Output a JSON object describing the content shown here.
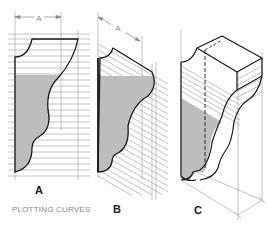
{
  "figure": {
    "caption": "PLOTTING CURVES",
    "panels": [
      {
        "id": "A",
        "label": "A",
        "view": "front elevation with horizontal plotting lines"
      },
      {
        "id": "B",
        "label": "B",
        "view": "oblique profile with slanted plotting lines"
      },
      {
        "id": "C",
        "label": "C",
        "view": "isometric block with plotted curved face"
      }
    ],
    "dimension_labels": {
      "panel_a": "A",
      "panel_b": "A"
    },
    "colors": {
      "outline": "#1a1a1a",
      "construction_line": "#9a9a9a",
      "shade_fill": "#bdbdbd",
      "caption": "#8a8a8a",
      "background": "#ffffff"
    }
  }
}
